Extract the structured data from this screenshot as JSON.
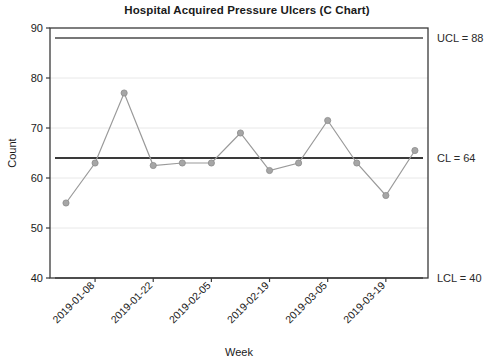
{
  "chart_data": {
    "type": "line",
    "title": "Hospital Acquired Pressure Ulcers (C Chart)",
    "xlabel": "Week",
    "ylabel": "Count",
    "ylim": [
      40,
      90
    ],
    "yticks": [
      40,
      50,
      60,
      70,
      80,
      90
    ],
    "grid": true,
    "legend": "none",
    "x": [
      "2019-01-01",
      "2019-01-08",
      "2019-01-15",
      "2019-01-22",
      "2019-01-29",
      "2019-02-05",
      "2019-02-12",
      "2019-02-19",
      "2019-02-26",
      "2019-03-05",
      "2019-03-12",
      "2019-03-19",
      "2019-03-26"
    ],
    "xticklabels": [
      "2019-01-08",
      "2019-01-22",
      "2019-02-05",
      "2019-02-19",
      "2019-03-05",
      "2019-03-19"
    ],
    "xtick_indices": [
      1,
      3,
      5,
      7,
      9,
      11
    ],
    "values": [
      55,
      63,
      77,
      62.5,
      63,
      63,
      69,
      61.5,
      63,
      71.5,
      63,
      56.5,
      65.5
    ],
    "annotations": [
      {
        "name": "ucl",
        "label": "UCL = 88",
        "value": 88
      },
      {
        "name": "cl",
        "label": "CL = 64",
        "value": 64
      },
      {
        "name": "lcl",
        "label": "LCL = 40",
        "value": 40
      }
    ],
    "colors": {
      "series": "#a6a6a6",
      "center_line": "#3a3a3a",
      "control_limit": "#4a4a4a",
      "grid": "#e8e8e8",
      "frame": "#3a3a3a",
      "text": "#1a1a1a"
    }
  }
}
